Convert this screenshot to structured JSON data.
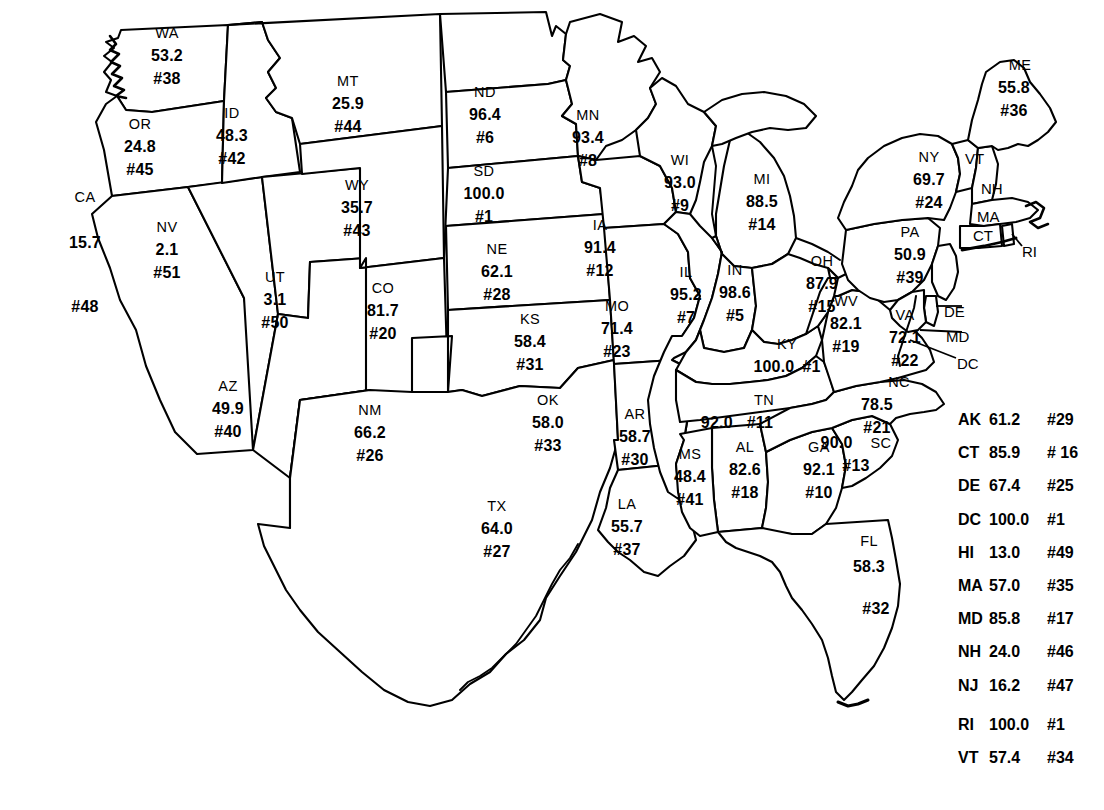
{
  "chart_data": {
    "type": "map",
    "title": "",
    "subtitle": "",
    "value_unit": "percent",
    "rank_prefix": "#",
    "states": [
      {
        "abbr": "WA",
        "value": "53.2",
        "rank": "#38",
        "x": 167,
        "y": 56
      },
      {
        "abbr": "OR",
        "value": "24.8",
        "rank": "#45",
        "x": 140,
        "y": 147
      },
      {
        "abbr": "CA",
        "value": "15.7",
        "rank": "#48",
        "x": 85,
        "y": 252
      },
      {
        "abbr": "NV",
        "value": "2.1",
        "rank": "#51",
        "x": 167,
        "y": 250
      },
      {
        "abbr": "ID",
        "value": "48.3",
        "rank": "#42",
        "x": 232,
        "y": 136
      },
      {
        "abbr": "UT",
        "value": "3.1",
        "rank": "#50",
        "x": 275,
        "y": 300
      },
      {
        "abbr": "AZ",
        "value": "49.9",
        "rank": "#40",
        "x": 228,
        "y": 409
      },
      {
        "abbr": "MT",
        "value": "25.9",
        "rank": "#44",
        "x": 348,
        "y": 104
      },
      {
        "abbr": "WY",
        "value": "35.7",
        "rank": "#43",
        "x": 357,
        "y": 208
      },
      {
        "abbr": "CO",
        "value": "81.7",
        "rank": "#20",
        "x": 383,
        "y": 311
      },
      {
        "abbr": "NM",
        "value": "66.2",
        "rank": "#26",
        "x": 370,
        "y": 433
      },
      {
        "abbr": "ND",
        "value": "96.4",
        "rank": "#6",
        "x": 485,
        "y": 115
      },
      {
        "abbr": "SD",
        "value": "100.0",
        "rank": "#1",
        "x": 484,
        "y": 194
      },
      {
        "abbr": "NE",
        "value": "62.1",
        "rank": "#28",
        "x": 497,
        "y": 272
      },
      {
        "abbr": "KS",
        "value": "58.4",
        "rank": "#31",
        "x": 530,
        "y": 342
      },
      {
        "abbr": "OK",
        "value": "58.0",
        "rank": "#33",
        "x": 548,
        "y": 423
      },
      {
        "abbr": "TX",
        "value": "64.0",
        "rank": "#27",
        "x": 497,
        "y": 529
      },
      {
        "abbr": "MN",
        "value": "93.4",
        "rank": "#8",
        "x": 588,
        "y": 138
      },
      {
        "abbr": "IA",
        "value": "91.4",
        "rank": "#12",
        "x": 600,
        "y": 248
      },
      {
        "abbr": "MO",
        "value": "71.4",
        "rank": "#23",
        "x": 617,
        "y": 329
      },
      {
        "abbr": "AR",
        "value": "58.7",
        "rank": "#30",
        "x": 635,
        "y": 437
      },
      {
        "abbr": "LA",
        "value": "55.7",
        "rank": "#37",
        "x": 627,
        "y": 527
      },
      {
        "abbr": "WI",
        "value": "93.0",
        "rank": "#9",
        "x": 680,
        "y": 183
      },
      {
        "abbr": "IL",
        "value": "95.2",
        "rank": "#7",
        "x": 686,
        "y": 295
      },
      {
        "abbr": "MS",
        "value": "48.4",
        "rank": "#41",
        "x": 690,
        "y": 477
      },
      {
        "abbr": "MI",
        "value": "88.5",
        "rank": "#14",
        "x": 762,
        "y": 202
      },
      {
        "abbr": "IN",
        "value": "98.6",
        "rank": "#5",
        "x": 735,
        "y": 293
      },
      {
        "abbr": "KY",
        "value": "100.0",
        "rank": "#1",
        "x": 787,
        "y": 356
      },
      {
        "abbr": "TN",
        "value": "92.0",
        "rank": "#11",
        "x": 737,
        "y": 412
      },
      {
        "abbr": "AL",
        "value": "82.6",
        "rank": "#18",
        "x": 745,
        "y": 470
      },
      {
        "abbr": "OH",
        "value": "87.9",
        "rank": "#15",
        "x": 822,
        "y": 284
      },
      {
        "abbr": "WV",
        "value": "82.1",
        "rank": "#19",
        "x": 846,
        "y": 324
      },
      {
        "abbr": "GA",
        "value": "92.1",
        "rank": "#10",
        "x": 819,
        "y": 470
      },
      {
        "abbr": "FL",
        "value": "58.3",
        "rank": "#32",
        "x": 869,
        "y": 575
      },
      {
        "abbr": "SC",
        "value": "90.0",
        "rank": "#13",
        "x": 856,
        "y": 454
      },
      {
        "abbr": "NC",
        "value": "78.5",
        "rank": "#21",
        "x": 877,
        "y": 405
      },
      {
        "abbr": "VA",
        "value": "72.1",
        "rank": "#22",
        "x": 905,
        "y": 338
      },
      {
        "abbr": "PA",
        "value": "50.9",
        "rank": "#39",
        "x": 910,
        "y": 255
      },
      {
        "abbr": "NY",
        "value": "69.7",
        "rank": "#24",
        "x": 929,
        "y": 180
      },
      {
        "abbr": "ME",
        "value": "55.8",
        "rank": "#36",
        "x": 1014,
        "y": 88
      }
    ],
    "small_state_labels": [
      {
        "abbr": "VT",
        "x": 965,
        "y": 158
      },
      {
        "abbr": "NH",
        "x": 981,
        "y": 188
      },
      {
        "abbr": "MA",
        "x": 977,
        "y": 216
      },
      {
        "abbr": "CT",
        "x": 973,
        "y": 235
      },
      {
        "abbr": "RI",
        "x": 1022,
        "y": 251
      },
      {
        "abbr": "DE",
        "x": 944,
        "y": 311
      },
      {
        "abbr": "MD",
        "x": 946,
        "y": 336
      },
      {
        "abbr": "DC",
        "x": 957,
        "y": 363
      }
    ],
    "legend": {
      "primary_rows": [
        {
          "abbr": "AK",
          "value": "61.2",
          "rank": "#29"
        },
        {
          "abbr": "CT",
          "value": "85.9",
          "rank": "# 16"
        },
        {
          "abbr": "DE",
          "value": "67.4",
          "rank": "#25"
        },
        {
          "abbr": "DC",
          "value": "100.0",
          "rank": "#1"
        },
        {
          "abbr": "HI",
          "value": "13.0",
          "rank": "#49"
        },
        {
          "abbr": "MA",
          "value": "57.0",
          "rank": "#35"
        },
        {
          "abbr": "MD",
          "value": "85.8",
          "rank": "#17"
        },
        {
          "abbr": "NH",
          "value": "24.0",
          "rank": "#46"
        },
        {
          "abbr": "NJ",
          "value": "16.2",
          "rank": "#47"
        }
      ],
      "secondary_rows": [
        {
          "abbr": "RI",
          "value": "100.0",
          "rank": "#1"
        },
        {
          "abbr": "VT",
          "value": "57.4",
          "rank": "#34"
        }
      ]
    },
    "colors": {
      "stroke": "#000000",
      "fill": "#ffffff",
      "text": "#000000",
      "background": "#ffffff"
    }
  }
}
